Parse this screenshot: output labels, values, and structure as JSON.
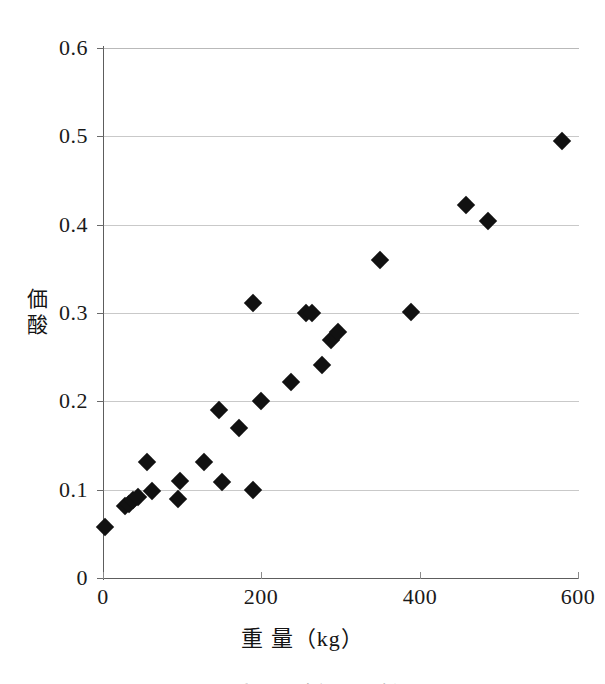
{
  "chart_data": {
    "type": "scatter",
    "title": "",
    "xlabel": "重  量（kg）",
    "ylabel": "酸  価",
    "ylabel_chars": [
      "価",
      "酸"
    ],
    "xlim": [
      0,
      600
    ],
    "ylim": [
      0,
      0.6
    ],
    "xticks": [
      0,
      200,
      400,
      600
    ],
    "xtick_labels": [
      "0",
      "200",
      "400",
      "600"
    ],
    "yticks": [
      0,
      0.1,
      0.2,
      0.3,
      0.4,
      0.5,
      0.6
    ],
    "ytick_labels": [
      "0",
      "0.1",
      "0.2",
      "0.3",
      "0.4",
      "0.5",
      "0.6"
    ],
    "grid": "horizontal",
    "legend": "none",
    "marker": "filled-diamond",
    "marker_color": "#111111",
    "points": [
      {
        "x": 2,
        "y": 0.058
      },
      {
        "x": 28,
        "y": 0.081
      },
      {
        "x": 33,
        "y": 0.084
      },
      {
        "x": 38,
        "y": 0.088
      },
      {
        "x": 44,
        "y": 0.092
      },
      {
        "x": 55,
        "y": 0.131
      },
      {
        "x": 62,
        "y": 0.099
      },
      {
        "x": 95,
        "y": 0.089
      },
      {
        "x": 97,
        "y": 0.11
      },
      {
        "x": 128,
        "y": 0.131
      },
      {
        "x": 147,
        "y": 0.19
      },
      {
        "x": 150,
        "y": 0.109
      },
      {
        "x": 172,
        "y": 0.17
      },
      {
        "x": 189,
        "y": 0.311
      },
      {
        "x": 190,
        "y": 0.1
      },
      {
        "x": 200,
        "y": 0.2
      },
      {
        "x": 238,
        "y": 0.222
      },
      {
        "x": 256,
        "y": 0.3
      },
      {
        "x": 264,
        "y": 0.3
      },
      {
        "x": 276,
        "y": 0.241
      },
      {
        "x": 288,
        "y": 0.269
      },
      {
        "x": 297,
        "y": 0.279
      },
      {
        "x": 350,
        "y": 0.36
      },
      {
        "x": 389,
        "y": 0.301
      },
      {
        "x": 458,
        "y": 0.422
      },
      {
        "x": 486,
        "y": 0.404
      },
      {
        "x": 580,
        "y": 0.495
      }
    ]
  },
  "caption": {
    "cut_off_line": "図  重量と酸価の関係"
  }
}
